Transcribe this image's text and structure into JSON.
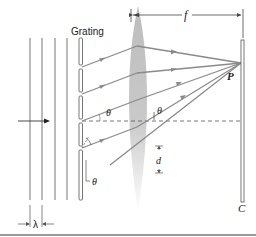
{
  "diagram": {
    "labels": {
      "grating": "Grating",
      "focal_length": "f",
      "point": "P",
      "screen": "C",
      "angle_top": "θ",
      "angle_lens": "θ",
      "angle_bottom": "θ",
      "slit_spacing": "d",
      "wavelength": "λ"
    },
    "colors": {
      "ray": "#8a8a8a",
      "lens": "#c8c8c8",
      "line": "#555555",
      "divider": "#9a9a9a"
    },
    "elements": {
      "wavefront_count": 4,
      "slit_count": 4,
      "ray_count": 5
    }
  }
}
